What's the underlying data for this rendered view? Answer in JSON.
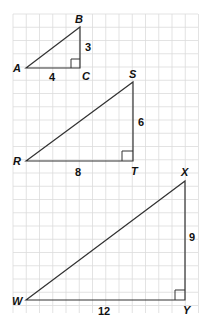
{
  "figure": {
    "triangles": [
      {
        "name": "ABC",
        "vertices": {
          "A": "A",
          "B": "B",
          "C": "C"
        },
        "right_angle_at": "C",
        "sides": {
          "AC": "4",
          "BC": "3"
        }
      },
      {
        "name": "RST",
        "vertices": {
          "R": "R",
          "S": "S",
          "T": "T"
        },
        "right_angle_at": "T",
        "sides": {
          "RT": "8",
          "ST": "6"
        }
      },
      {
        "name": "WXY",
        "vertices": {
          "W": "W",
          "X": "X",
          "Y": "Y"
        },
        "right_angle_at": "Y",
        "sides": {
          "WY": "12",
          "XY": "9"
        }
      }
    ],
    "colors": {
      "grid": "#dcdcdc",
      "lines": "#333333",
      "text": "#111111"
    }
  }
}
